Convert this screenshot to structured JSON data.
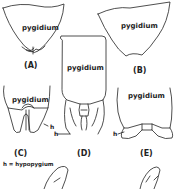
{
  "diagram": {
    "type": "anatomical-illustration",
    "panels": [
      {
        "id": "A",
        "label": "(A)",
        "part_label": "pygidium"
      },
      {
        "id": "B",
        "label": "(B)",
        "part_label": "pygidium"
      },
      {
        "id": "C",
        "label": "(C)",
        "part_label": "pygidium",
        "annotation": "h"
      },
      {
        "id": "D",
        "label": "(D)",
        "part_label": "pygidium",
        "annotation": "h"
      },
      {
        "id": "E",
        "label": "(E)",
        "part_label": "pygidium",
        "annotation": "h"
      }
    ],
    "legend": "h = hypopygium",
    "line_color": "#222222",
    "background": "#ffffff"
  }
}
